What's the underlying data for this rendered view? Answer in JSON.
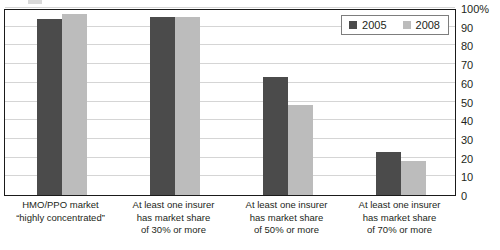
{
  "chart_data": {
    "type": "bar",
    "title": "",
    "subtitle": "",
    "xlabel": "",
    "ylabel": "",
    "ylim": [
      0,
      100
    ],
    "y_unit": "%",
    "grid": true,
    "legend_position": "top-right-inside",
    "categories": [
      "HMO/PPO market “highly concentrated”",
      "At least one insurer has market share of 30% or more",
      "At least one insurer has market share of 50% or more",
      "At least one insurer has market share of 70% or more"
    ],
    "category_lines": [
      [
        "HMO/PPO market",
        "“highly concentrated”"
      ],
      [
        "At least one insurer",
        "has market share",
        "of 30% or more"
      ],
      [
        "At least one insurer",
        "has market share",
        "of 50% or more"
      ],
      [
        "At least one insurer",
        "has market share",
        "of 70% or more"
      ]
    ],
    "series": [
      {
        "name": "2005",
        "color": "#4b4b4b",
        "values": [
          94,
          95,
          63,
          23
        ]
      },
      {
        "name": "2008",
        "color": "#bcbcbc",
        "values": [
          97,
          95,
          48,
          18
        ]
      }
    ],
    "y_ticks": [
      {
        "value": 100,
        "label": "100%"
      },
      {
        "value": 90,
        "label": "90"
      },
      {
        "value": 80,
        "label": "80"
      },
      {
        "value": 70,
        "label": "70"
      },
      {
        "value": 60,
        "label": "60"
      },
      {
        "value": 50,
        "label": "50"
      },
      {
        "value": 40,
        "label": "40"
      },
      {
        "value": 30,
        "label": "30"
      },
      {
        "value": 20,
        "label": "20"
      },
      {
        "value": 10,
        "label": "10"
      },
      {
        "value": 0,
        "label": "0"
      }
    ]
  },
  "legend": {
    "entries": [
      {
        "label": "2005",
        "color": "#4b4b4b"
      },
      {
        "label": "2008",
        "color": "#bcbcbc"
      }
    ]
  },
  "colors": {
    "series_2005": "#4b4b4b",
    "series_2008": "#bcbcbc",
    "gridline": "#d5d5d5",
    "frame": "#1a1a1a",
    "text": "#231f20"
  }
}
